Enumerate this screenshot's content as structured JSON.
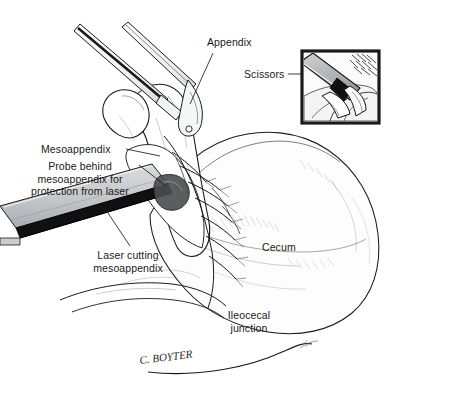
{
  "figure": {
    "background_color": "#ffffff",
    "ink_color": "#1a1a1a",
    "signature": "C. BOYTER"
  },
  "labels": {
    "appendix": "Appendix",
    "scissors": "Scissors",
    "mesoappendix": "Mesoappendix",
    "probe": "Probe behind\nmesoappendix for\nprotection from laser",
    "laser_cutting": "Laser cutting\nmesoappendix",
    "cecum": "Cecum",
    "ileocecal_junction": "Ileocecal\njunction"
  },
  "inset": {
    "name": "scissors-detail-inset",
    "caption": "Scissors",
    "border_color": "#1a1a1a",
    "fill_color": "#b9bcc0"
  },
  "instruments": {
    "grasper_upper": "grasper-forceps",
    "grasper_lower": "grasper-forceps",
    "probe_bar": "laser-protection-probe",
    "laser_beam": "laser-beam"
  },
  "anatomy": {
    "appendix": "appendix",
    "mesoappendix": "mesoappendix",
    "cecum": "cecum",
    "ileocecal_junction": "ileocecal-junction",
    "vessels": "mesoappendiceal-vessels"
  },
  "colors": {
    "probe_gray": "#c9cbcd",
    "probe_gray_dark": "#9a9da1",
    "laser_black": "#101010",
    "instrument_gray": "#e8e9ea",
    "tissue_white": "#fdfdfd"
  }
}
